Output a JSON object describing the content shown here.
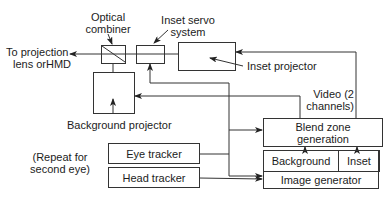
{
  "diagram": {
    "labels": {
      "optical_combiner_l1": "Optical",
      "optical_combiner_l2": "combiner",
      "inset_servo_l1": "Inset servo",
      "inset_servo_l2": "system",
      "to_projection_l1": "To projection",
      "to_projection_l2": "lens orHMD",
      "inset_projector": "Inset projector",
      "background_projector": "Background projector",
      "video_l1": "Video (2",
      "video_l2": "channels)",
      "repeat_l1": "(Repeat for",
      "repeat_l2": "second eye)"
    },
    "boxes": {
      "blend_zone_l1": "Blend zone",
      "blend_zone_l2": "generation",
      "eye_tracker": "Eye tracker",
      "head_tracker": "Head tracker",
      "background": "Background",
      "inset": "Inset",
      "image_generator": "Image generator"
    },
    "colors": {
      "line": "#333333",
      "text": "#1c1c1c",
      "background": "#ffffff"
    }
  }
}
